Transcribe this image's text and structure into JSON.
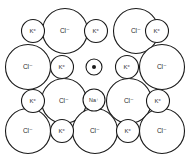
{
  "figure": {
    "name": "ionic-crystal-lattice-f-center",
    "width": 189,
    "height": 160,
    "background_color": "#ffffff",
    "stroke_color": "#1a1a1a",
    "label_color": "#2b2b2b"
  },
  "legend_symbols": {
    "anion": "Cl⁻",
    "cation_large": "K⁺",
    "cation_small": "Na⁺",
    "electron": "e⁻"
  },
  "chart_data": {
    "type": "scatter",
    "title": "",
    "xlabel": "",
    "ylabel": "",
    "xlim": [
      0,
      189
    ],
    "ylim": [
      0,
      160
    ],
    "grid": false,
    "legend_position": "none",
    "series": [
      {
        "name": "Cl⁻",
        "label": "Cl⁻",
        "radius": 22.5,
        "font_size": 6.5,
        "stroke_width": 1.1,
        "points": [
          {
            "x": 65,
            "y": 31
          },
          {
            "x": 136,
            "y": 31
          },
          {
            "x": 28,
            "y": 67
          },
          {
            "x": 162,
            "y": 67
          },
          {
            "x": 64,
            "y": 101
          },
          {
            "x": 129,
            "y": 101
          },
          {
            "x": 28,
            "y": 131
          },
          {
            "x": 95,
            "y": 131
          },
          {
            "x": 162,
            "y": 131
          }
        ]
      },
      {
        "name": "K⁺",
        "label": "K⁺",
        "radius": 11.5,
        "font_size": 6,
        "stroke_width": 1.1,
        "points": [
          {
            "x": 33,
            "y": 31
          },
          {
            "x": 96,
            "y": 31
          },
          {
            "x": 157,
            "y": 31
          },
          {
            "x": 62,
            "y": 67
          },
          {
            "x": 127,
            "y": 67
          },
          {
            "x": 33,
            "y": 101
          },
          {
            "x": 158,
            "y": 101
          },
          {
            "x": 62,
            "y": 131
          },
          {
            "x": 128,
            "y": 131
          }
        ]
      },
      {
        "name": "Na⁺",
        "label": "Na⁺",
        "radius": 11,
        "font_size": 5.4,
        "stroke_width": 1.1,
        "points": [
          {
            "x": 94,
            "y": 100
          }
        ]
      },
      {
        "name": "e⁻",
        "label": "",
        "radius": 8,
        "font_size": 5,
        "stroke_width": 1.1,
        "inner_dot_radius": 2,
        "points": [
          {
            "x": 94,
            "y": 67
          }
        ]
      }
    ]
  }
}
